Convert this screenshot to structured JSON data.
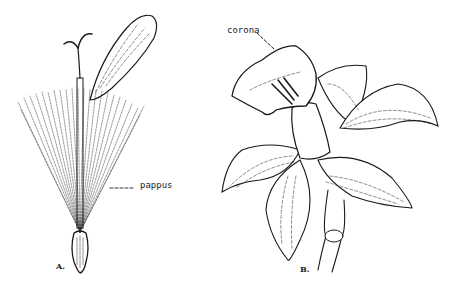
{
  "figure": {
    "panels": [
      {
        "id": "A",
        "letter": "A.",
        "subject": "seed with pappus and style",
        "callout": {
          "label": "pappus"
        }
      },
      {
        "id": "B",
        "letter": "B.",
        "subject": "daffodil flower with corona",
        "callout": {
          "label": "corona"
        }
      }
    ]
  },
  "colors": {
    "ink": "#1a1a1a",
    "background": "#ffffff"
  }
}
